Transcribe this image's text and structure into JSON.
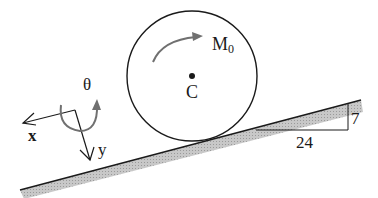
{
  "diagram": {
    "labels": {
      "moment": "M",
      "moment_sub": "0",
      "center": "C",
      "theta": "θ",
      "x_axis": "x",
      "y_axis": "y",
      "slope_run": "24",
      "slope_rise": "7"
    },
    "colors": {
      "line": "#1a1a1a",
      "arrow_gray": "#707070",
      "ground_hatch": "#b8b8b8"
    }
  }
}
